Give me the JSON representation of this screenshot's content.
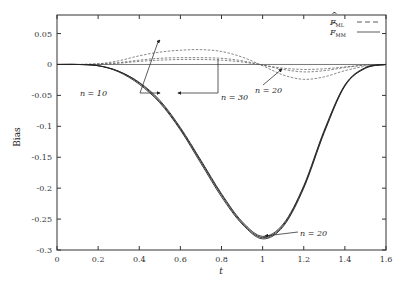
{
  "chart_data": {
    "type": "line",
    "title": "",
    "xlabel": "t",
    "ylabel": "Bias",
    "xlim": [
      0,
      1.6
    ],
    "ylim": [
      -0.3,
      0.08
    ],
    "grid": false,
    "legend_position": "top-right",
    "x_ticks": [
      0,
      0.2,
      0.4,
      0.6,
      0.8,
      1,
      1.2,
      1.4,
      1.6
    ],
    "x_tick_labels": [
      "0",
      "0.2",
      "0.4",
      "0.6",
      "0.8",
      "1",
      "1.2",
      "1.4",
      "1.6"
    ],
    "y_ticks": [
      0.05,
      0,
      -0.05,
      -0.1,
      -0.15,
      -0.2,
      -0.25,
      -0.3
    ],
    "y_tick_labels": [
      "0.05",
      "0",
      "-0.05",
      "-0.1",
      "-0.15",
      "-0.2",
      "-0.25",
      "-0.3"
    ],
    "legend": [
      {
        "label": "F̂_ML",
        "base": "F",
        "sub": "ML",
        "style": "dashed"
      },
      {
        "label": "F̂_MM",
        "base": "F",
        "sub": "MM",
        "style": "solid"
      }
    ],
    "x": [
      0,
      0.1,
      0.2,
      0.3,
      0.4,
      0.5,
      0.6,
      0.7,
      0.8,
      0.9,
      1.0,
      1.1,
      1.2,
      1.3,
      1.4,
      1.5,
      1.6
    ],
    "series": [
      {
        "name": "F̂_ML n = 10",
        "style": "dashed",
        "values": [
          0,
          0,
          0.001,
          0.006,
          0.014,
          0.02,
          0.023,
          0.024,
          0.021,
          0.012,
          -0.002,
          -0.017,
          -0.024,
          -0.02,
          -0.01,
          -0.003,
          0
        ]
      },
      {
        "name": "F̂_ML n = 20",
        "style": "dashed",
        "values": [
          0,
          0,
          0.001,
          0.003,
          0.007,
          0.01,
          0.011,
          0.011,
          0.01,
          0.006,
          -0.001,
          -0.008,
          -0.012,
          -0.01,
          -0.005,
          -0.001,
          0
        ]
      },
      {
        "name": "F̂_ML n = 30",
        "style": "dashed",
        "values": [
          0,
          0,
          0.0,
          0.002,
          0.005,
          0.007,
          0.008,
          0.008,
          0.007,
          0.004,
          -0.001,
          -0.006,
          -0.008,
          -0.007,
          -0.004,
          -0.001,
          0
        ]
      },
      {
        "name": "F̂_MM n = 10",
        "style": "solid",
        "values": [
          0,
          0,
          -0.002,
          -0.012,
          -0.032,
          -0.062,
          -0.106,
          -0.16,
          -0.214,
          -0.258,
          -0.282,
          -0.262,
          -0.2,
          -0.11,
          -0.035,
          -0.006,
          0
        ]
      },
      {
        "name": "F̂_MM n = 20",
        "style": "solid",
        "values": [
          0,
          0,
          -0.002,
          -0.011,
          -0.03,
          -0.06,
          -0.104,
          -0.157,
          -0.211,
          -0.256,
          -0.28,
          -0.26,
          -0.198,
          -0.108,
          -0.034,
          -0.006,
          0
        ]
      },
      {
        "name": "F̂_MM n = 30",
        "style": "solid",
        "values": [
          0,
          0,
          -0.002,
          -0.011,
          -0.029,
          -0.058,
          -0.102,
          -0.155,
          -0.209,
          -0.254,
          -0.278,
          -0.258,
          -0.196,
          -0.106,
          -0.033,
          -0.005,
          0
        ]
      }
    ],
    "annotations": [
      {
        "text": "n = 10",
        "x": 0.38,
        "y": -0.047
      },
      {
        "text": "n = 30",
        "x": 0.9,
        "y": -0.047
      },
      {
        "text": "n = 20",
        "x": 1.05,
        "y": -0.012
      },
      {
        "text": "n = 20",
        "x": 1.17,
        "y": -0.275
      }
    ]
  },
  "annotations": {
    "n10": "n = 10",
    "n30": "n = 30",
    "n20_top": "n = 20",
    "n20_bottom": "n = 20"
  },
  "axes": {
    "xlabel": "t",
    "ylabel": "Bias"
  }
}
